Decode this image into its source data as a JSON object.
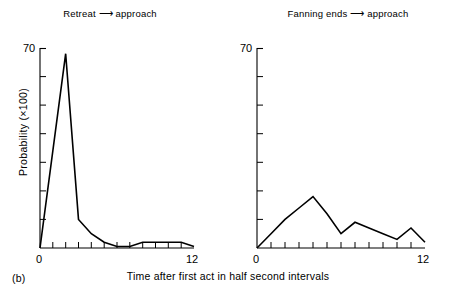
{
  "figure": {
    "caption_label": "(b)",
    "xlabel": "Time after first act in half second intervals",
    "ylabel": "Probability (×100)"
  },
  "panels": [
    {
      "title": "Retreat ⟶ approach",
      "title_left": "Retreat",
      "title_right": "approach"
    },
    {
      "title": "Fanning ends ⟶ approach",
      "title_left": "Fanning ends",
      "title_right": "approach"
    }
  ],
  "axes": {
    "y_max_label": "70",
    "y_min_label": "0",
    "x_min_label": "0",
    "x_max_label": "12",
    "y_ticks": [
      0,
      10,
      20,
      30,
      40,
      50,
      60,
      70
    ],
    "x_ticks": [
      0,
      1,
      2,
      3,
      4,
      5,
      6,
      7,
      8,
      9,
      10,
      11,
      12
    ]
  },
  "chart_data": [
    {
      "type": "line",
      "title": "Retreat ⟶ approach",
      "xlabel": "Time after first act in half second intervals",
      "ylabel": "Probability (×100)",
      "xlim": [
        0,
        12
      ],
      "ylim": [
        0,
        70
      ],
      "grid": false,
      "legend": "none",
      "x": [
        0,
        1,
        2,
        3,
        4,
        5,
        6,
        7,
        8,
        9,
        10,
        11,
        12
      ],
      "values": [
        0,
        34,
        68,
        10,
        5,
        2,
        0.5,
        0.5,
        2,
        2,
        2,
        2,
        0.5
      ]
    },
    {
      "type": "line",
      "title": "Fanning ends ⟶ approach",
      "xlabel": "Time after first act in half second intervals",
      "ylabel": "Probability (×100)",
      "xlim": [
        0,
        12
      ],
      "ylim": [
        0,
        70
      ],
      "grid": false,
      "legend": "none",
      "x": [
        0,
        1,
        2,
        3,
        4,
        5,
        6,
        7,
        8,
        9,
        10,
        11,
        12
      ],
      "values": [
        0,
        5,
        10,
        14,
        18,
        12,
        5,
        9,
        7,
        5,
        3,
        7,
        2
      ]
    }
  ],
  "colors": {
    "ink": "#000000",
    "background": "#ffffff"
  }
}
